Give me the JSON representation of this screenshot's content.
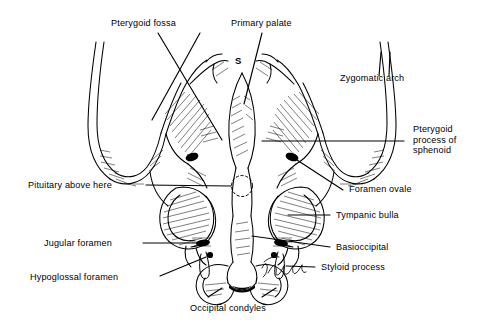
{
  "figure": {
    "style": "pen-and-ink line drawing with hatching",
    "background_color": "#ffffff",
    "ink_color": "#000000",
    "signature": "J. Landry"
  },
  "midline_marker": {
    "label": "S",
    "meaning": "midline sphenoid / median marker"
  },
  "labels": [
    {
      "id": "pterygoid-fossa",
      "text": "Pterygoid fossa",
      "lines": [
        "Pterygoid fossa"
      ]
    },
    {
      "id": "primary-palate",
      "text": "Primary palate",
      "lines": [
        "Primary palate"
      ]
    },
    {
      "id": "zygomatic-arch",
      "text": "Zygomatic arch",
      "lines": [
        "Zygomatic arch"
      ]
    },
    {
      "id": "pterygoid-process",
      "text": "Pterygoid process of sphenoid",
      "lines": [
        "Pterygoid",
        "process of",
        "sphenoid"
      ]
    },
    {
      "id": "pituitary",
      "text": "Pituitary above here",
      "lines": [
        "Pituitary above here"
      ]
    },
    {
      "id": "foramen-ovale",
      "text": "Foramen ovale",
      "lines": [
        "Foramen ovale"
      ]
    },
    {
      "id": "tympanic-bulla",
      "text": "Tympanic bulla",
      "lines": [
        "Tympanic bulla"
      ]
    },
    {
      "id": "jugular-foramen",
      "text": "Jugular foramen",
      "lines": [
        "Jugular foramen"
      ]
    },
    {
      "id": "basioccipital",
      "text": "Basioccipital",
      "lines": [
        "Basioccipital"
      ]
    },
    {
      "id": "hypoglossal-foramen",
      "text": "Hypoglossal foramen",
      "lines": [
        "Hypoglossal foramen"
      ]
    },
    {
      "id": "styloid-process",
      "text": "Styloid process",
      "lines": [
        "Styloid process"
      ]
    },
    {
      "id": "occipital-condyles",
      "text": "Occipital condyles",
      "lines": [
        "Occipital condyles"
      ]
    }
  ],
  "label_text": {
    "pterygoid_fossa": "Pterygoid fossa",
    "primary_palate": "Primary palate",
    "zygomatic_arch": "Zygomatic arch",
    "pterygoid_process_l1": "Pterygoid",
    "pterygoid_process_l2": "process of",
    "pterygoid_process_l3": "sphenoid",
    "pituitary": "Pituitary above here",
    "foramen_ovale": "Foramen ovale",
    "tympanic_bulla": "Tympanic bulla",
    "jugular_foramen": "Jugular foramen",
    "basioccipital": "Basioccipital",
    "hypoglossal_foramen": "Hypoglossal foramen",
    "styloid_process": "Styloid process",
    "occipital_condyles": "Occipital condyles",
    "midline_s": "S"
  }
}
